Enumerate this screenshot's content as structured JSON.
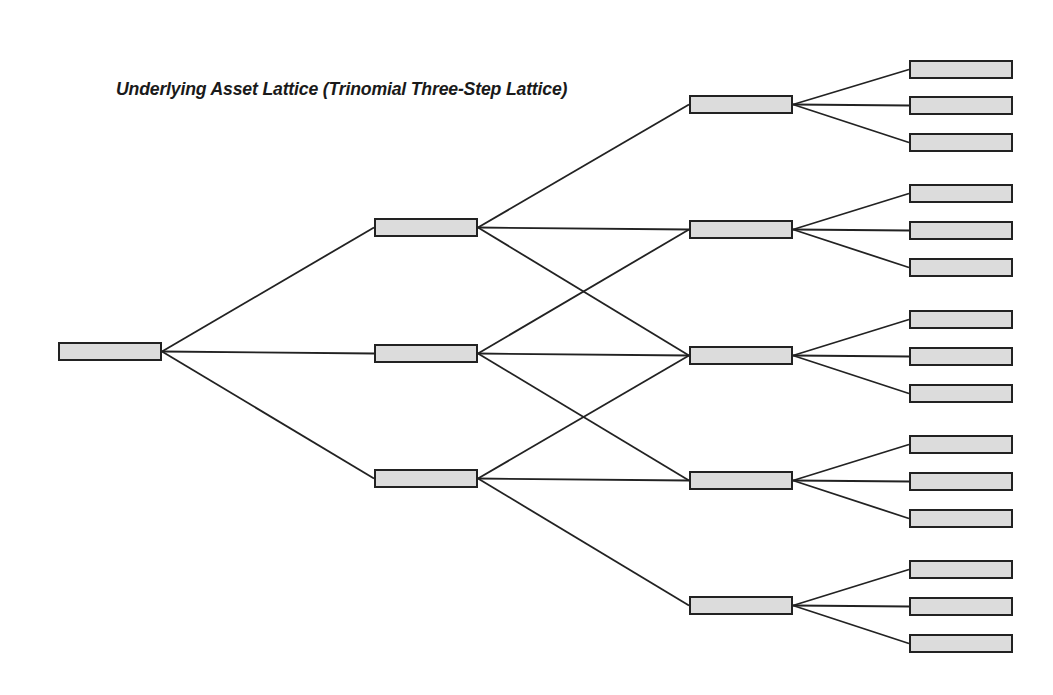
{
  "title": "Underlying Asset Lattice (Trinomial Three-Step Lattice)",
  "colors": {
    "node_fill": "#dcdcdc",
    "node_border": "#222222",
    "line": "#222222",
    "background": "#ffffff"
  },
  "lattice": {
    "type": "trinomial",
    "steps": 3,
    "node_width": 104,
    "node_height": 19,
    "columns": [
      {
        "step": 0,
        "x": 58,
        "nodes_y": [
          342
        ]
      },
      {
        "step": 1,
        "x": 374,
        "nodes_y": [
          218,
          344,
          469
        ]
      },
      {
        "step": 2,
        "x": 689,
        "nodes_y": [
          95,
          220,
          346,
          471,
          596
        ]
      },
      {
        "step": 3,
        "x": 909,
        "nodes_y": [
          60,
          96,
          133,
          184,
          221,
          258,
          310,
          347,
          384,
          435,
          472,
          509,
          560,
          597,
          634
        ]
      }
    ],
    "node_labels": "all nodes blank (no values shown)"
  }
}
